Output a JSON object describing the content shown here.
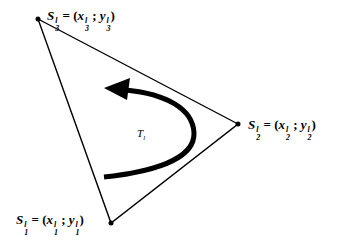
{
  "diagram": {
    "triangle_label": "T",
    "triangle_label_sub": "l",
    "vertices": [
      {
        "id": "S1",
        "name": "S",
        "sub": "1",
        "sup": "l",
        "eq": " = (",
        "x": "x",
        "x_sub": "1",
        "x_sup": "l",
        "sep": " ; ",
        "y": "y",
        "y_sub": "1",
        "y_sup": "l",
        "close": ")",
        "px": 111,
        "py": 223
      },
      {
        "id": "S2",
        "name": "S",
        "sub": "2",
        "sup": "l",
        "eq": " = (",
        "x": "x",
        "x_sub": "2",
        "x_sup": "l",
        "sep": " ; ",
        "y": "y",
        "y_sub": "2",
        "y_sup": "l",
        "close": ")",
        "px": 238,
        "py": 124
      },
      {
        "id": "S3",
        "name": "S",
        "sub": "3",
        "sup": "l",
        "eq": " = (",
        "x": "x",
        "x_sub": "3",
        "x_sup": "l",
        "sep": " ; ",
        "y": "y",
        "y_sub": "3",
        "y_sup": "l",
        "close": ")",
        "px": 38,
        "py": 19
      }
    ],
    "arrow": {
      "direction": "counter-clockwise",
      "color": "#000000"
    },
    "colors": {
      "stroke": "#000000",
      "background": "#ffffff"
    }
  }
}
